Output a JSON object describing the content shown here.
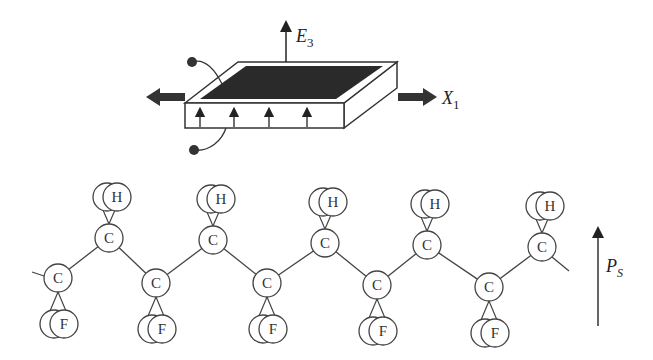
{
  "figure": {
    "film": {
      "field_label": "E",
      "field_subscript": "3",
      "stress_label": "X",
      "stress_subscript": "1",
      "dipole_arrow_count": 4
    },
    "chain": {
      "carbon_label": "C",
      "hydrogen_label": "H",
      "fluorine_label": "F",
      "polarization_label": "P",
      "polarization_subscript": "S",
      "top_carbons": [
        [
          109,
          238
        ],
        [
          213,
          240
        ],
        [
          325,
          243
        ],
        [
          427,
          245
        ],
        [
          542,
          247
        ]
      ],
      "bottom_carbons": [
        [
          58,
          278
        ],
        [
          156,
          283
        ],
        [
          267,
          283
        ],
        [
          377,
          285
        ],
        [
          489,
          287
        ]
      ]
    }
  }
}
